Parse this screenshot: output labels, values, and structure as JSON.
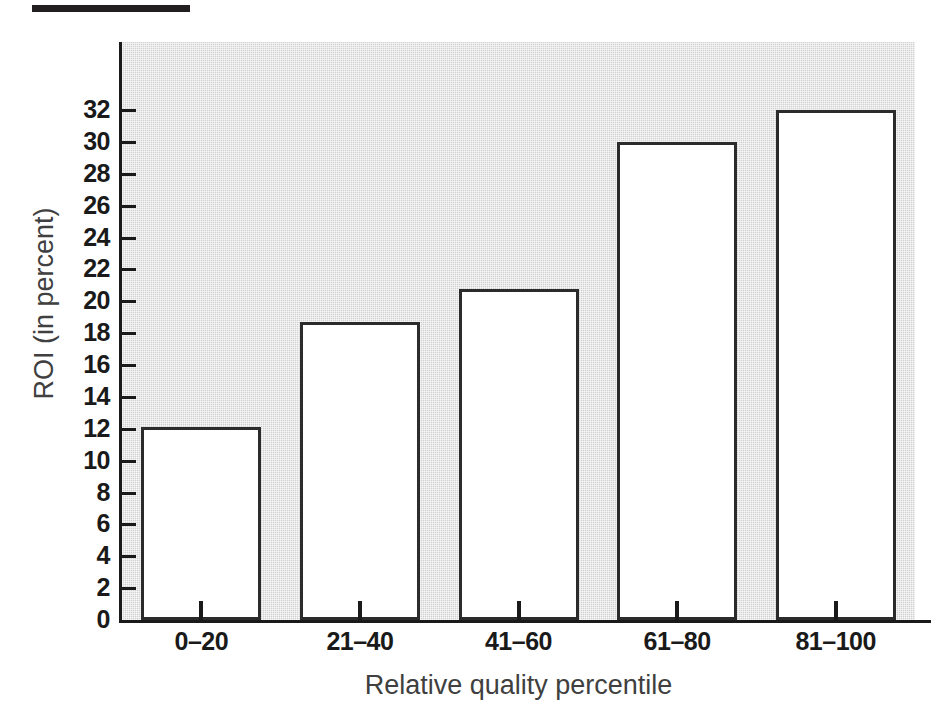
{
  "figure": {
    "top_rule": "decorative-rule"
  },
  "chart_data": {
    "type": "bar",
    "title": "",
    "xlabel": "Relative quality percentile",
    "ylabel": "ROI (in percent)",
    "categories": [
      "0–20",
      "21–40",
      "41–60",
      "61–80",
      "81–100"
    ],
    "values": [
      12.1,
      18.7,
      20.8,
      30.0,
      32.0
    ],
    "ylim": [
      0,
      32
    ],
    "ytick_step": 2,
    "yticks": [
      0,
      2,
      4,
      6,
      8,
      10,
      12,
      14,
      16,
      18,
      20,
      22,
      24,
      26,
      28,
      30,
      32
    ],
    "ytick_labels": [
      "0",
      "2",
      "4",
      "6",
      "8",
      "10",
      "12",
      "14",
      "16",
      "18",
      "20",
      "22",
      "24",
      "26",
      "28",
      "30",
      "32"
    ],
    "grid": false,
    "legend": null,
    "bar_face_color": "#ffffff",
    "bar_edge_color": "#2b2b2b",
    "plot_background_color": "#d2d2d2",
    "axis_color": "#1a1a1a",
    "label_color": "#404040"
  }
}
